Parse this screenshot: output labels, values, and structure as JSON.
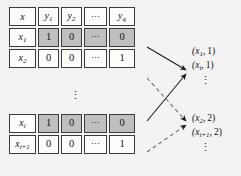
{
  "figure": {
    "name": "binary-relevance-transformation-diagram",
    "background_color": "#f4f3f1",
    "shade_color": "#bfbfbf",
    "border_color": "#3a3a3a"
  },
  "table": {
    "header": {
      "instance_col": "x",
      "labels": [
        {
          "base": "y",
          "sub": "1"
        },
        {
          "base": "y",
          "sub": "2"
        },
        {
          "base": "⋯",
          "sub": ""
        },
        {
          "base": "y",
          "sub": "q"
        }
      ]
    },
    "rows": [
      {
        "id_base": "x",
        "id_sub": "1",
        "shaded": true,
        "values": [
          "1",
          "0",
          "⋯",
          "0"
        ]
      },
      {
        "id_base": "x",
        "id_sub": "2",
        "shaded": false,
        "values": [
          "0",
          "0",
          "⋯",
          "1"
        ]
      },
      {
        "id_base": "x",
        "id_sub": "i",
        "shaded": true,
        "values": [
          "1",
          "0",
          "⋯",
          "0"
        ]
      },
      {
        "id_base": "x",
        "id_sub": "i+1",
        "shaded": false,
        "values": [
          "0",
          "0",
          "⋯",
          "1"
        ]
      }
    ],
    "group_gap_ellipsis": "⋮"
  },
  "outputs": {
    "class_one": {
      "pairs": [
        {
          "base": "(x",
          "sub": "1",
          "close": ",",
          "num": "1)"
        },
        {
          "base": "(x",
          "sub": "i",
          "close": ",",
          "num": "1)"
        }
      ],
      "ellipsis": "⋮"
    },
    "class_two": {
      "pairs": [
        {
          "base": "(x",
          "sub": "2",
          "close": ",",
          "num": "2)"
        },
        {
          "base": "(x",
          "sub": "i+1",
          "close": ",",
          "num": "2)"
        }
      ],
      "ellipsis": "⋮"
    }
  },
  "arrows": [
    {
      "name": "arrow-row-x1-to-class-one",
      "style": "solid"
    },
    {
      "name": "arrow-row-xi-to-class-one",
      "style": "solid"
    },
    {
      "name": "arrow-row-x2-to-class-two",
      "style": "dashed"
    },
    {
      "name": "arrow-row-xi1-to-class-two",
      "style": "dashed"
    }
  ]
}
